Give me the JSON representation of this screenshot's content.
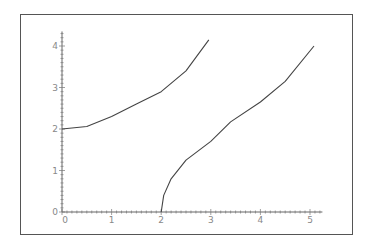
{
  "chart_data": {
    "type": "line",
    "title": "",
    "xlabel": "",
    "ylabel": "",
    "xlim": [
      0,
      5.2
    ],
    "ylim": [
      0,
      4.3
    ],
    "grid": false,
    "x_ticks": [
      "0",
      "1",
      "2",
      "3",
      "4",
      "5"
    ],
    "y_ticks": [
      "0",
      "1",
      "2",
      "3",
      "4"
    ],
    "series": [
      {
        "name": "curve-1",
        "x": [
          0,
          0.5,
          1,
          1.5,
          2,
          2.5,
          2.96
        ],
        "y": [
          2,
          2.06,
          2.3,
          2.6,
          2.9,
          3.4,
          4.15
        ]
      },
      {
        "name": "curve-2",
        "x": [
          2,
          2.05,
          2.2,
          2.5,
          3,
          3.4,
          4,
          4.5,
          5.08
        ],
        "y": [
          0,
          0.4,
          0.8,
          1.25,
          1.7,
          2.17,
          2.65,
          3.15,
          4.0
        ]
      }
    ]
  },
  "axes": {
    "origin_label_x": "0",
    "origin_label_y": "0"
  }
}
